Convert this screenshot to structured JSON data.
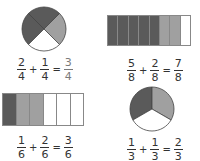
{
  "colors": {
    "dark": "#5a5a5a",
    "light": "#a0a0a0",
    "empty": "#ffffff",
    "outline": "#888888",
    "answer": "#7a7a7a"
  },
  "figures": [
    {
      "type": "circle",
      "parts": 4,
      "shading": [
        "dark",
        "dark",
        "light",
        "empty"
      ],
      "equation": {
        "a": {
          "num": "2",
          "den": "4"
        },
        "op": "+",
        "b": {
          "num": "1",
          "den": "4"
        },
        "eq": "=",
        "result": {
          "num": "3",
          "den": "4"
        }
      }
    },
    {
      "type": "bar",
      "parts": 8,
      "shading": [
        "dark",
        "dark",
        "dark",
        "dark",
        "dark",
        "light",
        "light",
        "empty"
      ],
      "equation": {
        "a": {
          "num": "5",
          "den": "8"
        },
        "op": "+",
        "b": {
          "num": "2",
          "den": "8"
        },
        "eq": "=",
        "result": {
          "num": "7",
          "den": "8"
        }
      }
    },
    {
      "type": "bar",
      "parts": 6,
      "shading": [
        "dark",
        "light",
        "light",
        "empty",
        "empty",
        "empty"
      ],
      "equation": {
        "a": {
          "num": "1",
          "den": "6"
        },
        "op": "+",
        "b": {
          "num": "2",
          "den": "6"
        },
        "eq": "=",
        "result": {
          "num": "3",
          "den": "6"
        }
      }
    },
    {
      "type": "circle",
      "parts": 3,
      "shading": [
        "dark",
        "light",
        "empty"
      ],
      "equation": {
        "a": {
          "num": "1",
          "den": "3"
        },
        "op": "+",
        "b": {
          "num": "1",
          "den": "3"
        },
        "eq": "=",
        "result": {
          "num": "2",
          "den": "3"
        }
      }
    }
  ]
}
